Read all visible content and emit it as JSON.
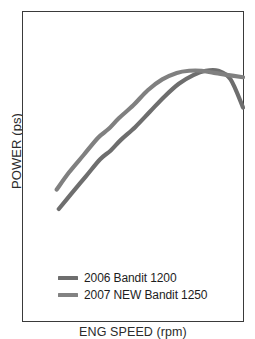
{
  "chart_data": {
    "type": "line",
    "title": "",
    "xlabel": "ENG SPEED (rpm)",
    "ylabel": "POWER (ps)",
    "grid": false,
    "legend_position": "bottom-left-inside",
    "axis_ticks": "none",
    "xlim": [
      0,
      100
    ],
    "ylim": [
      0,
      100
    ],
    "series": [
      {
        "name": "2006 Bandit 1200",
        "color": "#6e6e6e",
        "x": [
          11,
          17,
          24,
          31,
          36,
          41,
          48,
          55,
          62,
          69,
          76,
          82,
          88,
          94,
          100
        ],
        "y": [
          25,
          32,
          40,
          48,
          52,
          57,
          63,
          70,
          77,
          83,
          87,
          89,
          89,
          85,
          72
        ]
      },
      {
        "name": "2007 NEW Bandit 1250",
        "color": "#808080",
        "x": [
          10,
          16,
          23,
          30,
          35,
          40,
          47,
          54,
          61,
          68,
          74,
          80,
          86,
          93,
          100
        ],
        "y": [
          34,
          42,
          50,
          58,
          62,
          67,
          73,
          80,
          85,
          88,
          89,
          89,
          88,
          87,
          86
        ]
      }
    ]
  },
  "legend": {
    "items": [
      {
        "label": "2006 Bandit 1200",
        "color": "#6e6e6e"
      },
      {
        "label": "2007 NEW Bandit 1250",
        "color": "#828282"
      }
    ]
  },
  "axes": {
    "y_title": "POWER (ps)",
    "x_title": "ENG SPEED (rpm)"
  },
  "colors": {
    "frame": "#3a3a3a",
    "background": "#ffffff",
    "text": "#1d1d1d",
    "series_2006": "#6e6e6e",
    "series_2007": "#828282"
  }
}
